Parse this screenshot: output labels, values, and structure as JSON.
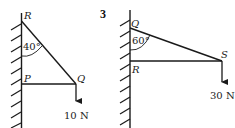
{
  "question_number": "3",
  "left_diagram": {
    "points": {
      "top": "R",
      "wall_lower": "P",
      "end": "Q"
    },
    "angle_label": "40°",
    "force_label": "10 N"
  },
  "right_diagram": {
    "points": {
      "top": "Q",
      "wall_lower": "R",
      "end": "S"
    },
    "angle_label": "60°",
    "force_label": "30 N"
  },
  "colors": {
    "line": "#1a1a1a",
    "background": "#ffffff"
  }
}
